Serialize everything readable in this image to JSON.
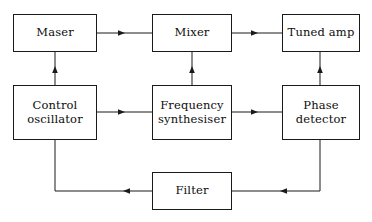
{
  "diagram": {
    "canvas": {
      "width": 372,
      "height": 222,
      "background": "#ffffff"
    },
    "line_color": "#1a1a1a",
    "text_color": "#0d0d0d",
    "nodes": [
      {
        "id": "maser",
        "label": "Maser",
        "x": 13,
        "y": 14,
        "w": 84,
        "h": 38
      },
      {
        "id": "mixer",
        "label": "Mixer",
        "x": 152,
        "y": 14,
        "w": 80,
        "h": 38
      },
      {
        "id": "tuned-amp",
        "label": "Tuned amp",
        "x": 282,
        "y": 14,
        "w": 78,
        "h": 38
      },
      {
        "id": "control-osc",
        "label": "Control\noscillator",
        "x": 13,
        "y": 85,
        "w": 84,
        "h": 55
      },
      {
        "id": "freq-synth",
        "label": "Frequency\nsynthesiser",
        "x": 152,
        "y": 85,
        "w": 80,
        "h": 55
      },
      {
        "id": "phase-det",
        "label": "Phase\ndetector",
        "x": 282,
        "y": 85,
        "w": 78,
        "h": 55
      },
      {
        "id": "filter",
        "label": "Filter",
        "x": 152,
        "y": 172,
        "w": 80,
        "h": 38
      }
    ],
    "connections": [
      {
        "id": "maser-to-mixer",
        "from": "maser",
        "to": "mixer",
        "direction": "right"
      },
      {
        "id": "mixer-to-tuned-amp",
        "from": "mixer",
        "to": "tuned-amp",
        "direction": "right"
      },
      {
        "id": "control-osc-to-maser",
        "from": "control-osc",
        "to": "maser",
        "direction": "up"
      },
      {
        "id": "freq-synth-to-mixer",
        "from": "freq-synth",
        "to": "mixer",
        "direction": "up"
      },
      {
        "id": "phase-det-to-tuned-amp",
        "from": "phase-det",
        "to": "tuned-amp",
        "direction": "up"
      },
      {
        "id": "control-osc-to-freq-synth",
        "from": "control-osc",
        "to": "freq-synth",
        "direction": "right"
      },
      {
        "id": "freq-synth-to-phase-det",
        "from": "freq-synth",
        "to": "phase-det",
        "direction": "right"
      },
      {
        "id": "phase-det-to-filter",
        "from": "phase-det",
        "to": "filter",
        "direction": "down-left"
      },
      {
        "id": "filter-to-control-osc",
        "from": "filter",
        "to": "control-osc",
        "direction": "left-up"
      }
    ]
  }
}
